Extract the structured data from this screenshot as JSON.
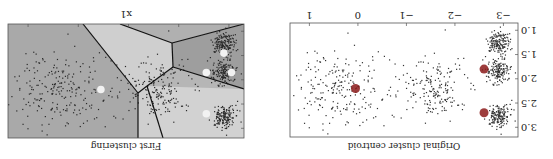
{
  "chart_data": [
    {
      "type": "scatter",
      "title": "Original cluster centroid",
      "xlabel": "",
      "ylabel": "",
      "xlim": [
        -3.3,
        1.4
      ],
      "ylim": [
        0.85,
        3.2
      ],
      "xticks": [
        -3,
        -2,
        -1,
        0,
        1
      ],
      "xtick_labels": [
        "−3",
        "−2",
        "−1",
        "0",
        "1"
      ],
      "yticks": [
        1.0,
        1.5,
        2.0,
        2.5,
        3.0
      ],
      "ytick_labels": [
        "1.0",
        "1.5",
        "2.0",
        "2.5",
        "3.0"
      ],
      "grid": false,
      "background": "#ffffff",
      "clusters": [
        {
          "center": [
            -2.9,
            1.25
          ],
          "spread": [
            0.12,
            0.12
          ],
          "n": 350
        },
        {
          "center": [
            -2.9,
            1.85
          ],
          "spread": [
            0.12,
            0.12
          ],
          "n": 350
        },
        {
          "center": [
            -2.9,
            2.75
          ],
          "spread": [
            0.12,
            0.12
          ],
          "n": 350
        },
        {
          "center": [
            -1.6,
            2.2
          ],
          "spread": [
            0.35,
            0.3
          ],
          "n": 400
        },
        {
          "center": [
            0.3,
            2.2
          ],
          "spread": [
            0.5,
            0.4
          ],
          "n": 500
        }
      ],
      "centroids": {
        "color": "#8b1a1a",
        "points": [
          [
            -2.6,
            1.8
          ],
          [
            -2.6,
            2.7
          ],
          [
            0.05,
            2.2
          ]
        ]
      }
    },
    {
      "type": "scatter",
      "title": "First clustering",
      "xlabel": "x1",
      "ylabel": "",
      "grid": false,
      "regions": {
        "colors": [
          "#a9a9a9",
          "#b6b6b6",
          "#cfcfcf",
          "#9e9e9e",
          "#b0b0b0"
        ],
        "boundary_color": "#111111"
      },
      "clusters": [
        {
          "center": [
            -2.9,
            1.25
          ],
          "spread": [
            0.12,
            0.12
          ],
          "n": 350
        },
        {
          "center": [
            -2.9,
            1.85
          ],
          "spread": [
            0.12,
            0.12
          ],
          "n": 350
        },
        {
          "center": [
            -2.9,
            2.75
          ],
          "spread": [
            0.12,
            0.12
          ],
          "n": 350
        },
        {
          "center": [
            -1.6,
            2.2
          ],
          "spread": [
            0.35,
            0.3
          ],
          "n": 400
        },
        {
          "center": [
            0.3,
            2.2
          ],
          "spread": [
            0.5,
            0.4
          ],
          "n": 500
        }
      ],
      "centroids": {
        "color": "#f2f2f2",
        "points": [
          [
            -2.55,
            1.85
          ],
          [
            -2.9,
            1.45
          ],
          [
            -3.05,
            1.85
          ],
          [
            -2.55,
            2.7
          ],
          [
            -0.45,
            2.2
          ]
        ]
      }
    }
  ],
  "labels": {
    "right_title": "Original cluster centroid",
    "left_title": "First clustering",
    "left_xlabel": "x1"
  }
}
